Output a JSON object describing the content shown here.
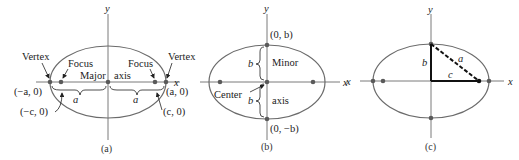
{
  "colors": {
    "ellipse": "#6b6b6b",
    "axis": "#7a7a7a",
    "dot": "#5a5a5a",
    "triangle": "#111111",
    "text": "#222222"
  },
  "panels": [
    {
      "caption": "(a)",
      "axis_x": "x",
      "axis_y": "y",
      "labels": {
        "vertex_left": "Vertex",
        "vertex_right": "Vertex",
        "focus_left": "Focus",
        "focus_right": "Focus",
        "major": "Major",
        "axis": "axis",
        "neg_a": "(−a, 0)",
        "neg_c": "(−c, 0)",
        "pos_a": "(a, 0)",
        "pos_c": "(c, 0)",
        "a_left": "a",
        "a_right": "a"
      }
    },
    {
      "caption": "(b)",
      "axis_x": "x",
      "axis_y": "y",
      "labels": {
        "top_point": "(0, b)",
        "bottom_point": "(0, −b)",
        "minor": "Minor",
        "axis": "axis",
        "center": "Center",
        "b_top": "b",
        "b_bottom": "b"
      }
    },
    {
      "caption": "(c)",
      "axis_x": "x",
      "axis_y": "y",
      "axis_x_left": "x",
      "labels": {
        "b": "b",
        "a": "a",
        "c": "c"
      }
    }
  ]
}
